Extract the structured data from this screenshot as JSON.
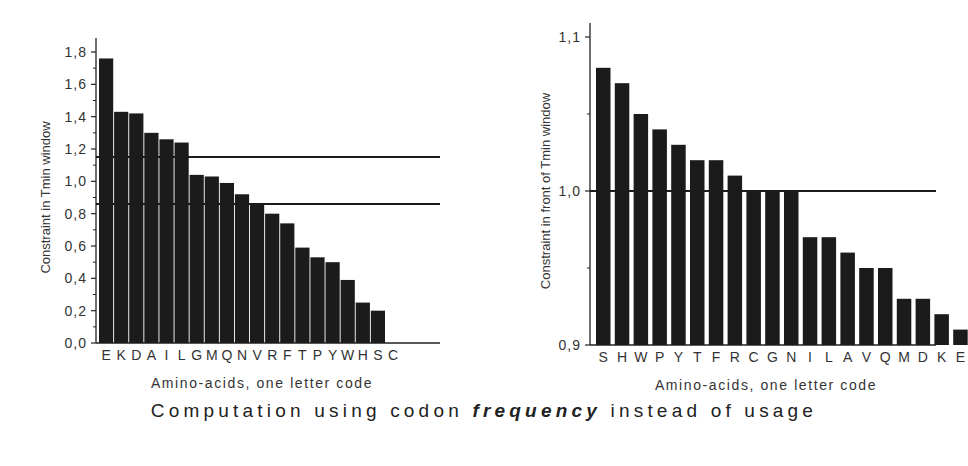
{
  "caption": {
    "prefix": "Computation using codon ",
    "emphasis": "frequency",
    "suffix": " instead of usage"
  },
  "chart_data": [
    {
      "type": "bar",
      "title": "",
      "xlabel": "Amino-acids, one letter code",
      "ylabel": "Constraint in Tmin window",
      "categories": [
        "E",
        "K",
        "D",
        "A",
        "I",
        "L",
        "G",
        "M",
        "Q",
        "N",
        "V",
        "R",
        "F",
        "T",
        "P",
        "Y",
        "W",
        "H",
        "S",
        "C"
      ],
      "values": [
        1.76,
        1.43,
        1.42,
        1.3,
        1.26,
        1.24,
        1.04,
        1.03,
        0.99,
        0.92,
        0.86,
        0.8,
        0.74,
        0.59,
        0.53,
        0.5,
        0.39,
        0.25,
        0.2,
        0.0
      ],
      "ylim": [
        0,
        1.8
      ],
      "yticks": [
        "0,0",
        "0,2",
        "0,4",
        "0,6",
        "0,8",
        "1,0",
        "1,2",
        "1,4",
        "1,6",
        "1,8"
      ],
      "reference_lines": [
        1.15,
        0.86
      ],
      "grid": false,
      "legend": null
    },
    {
      "type": "bar",
      "title": "",
      "xlabel": "Amino-acids, one letter code",
      "ylabel": "Constraint in front of Tmin window",
      "categories": [
        "S",
        "H",
        "W",
        "P",
        "Y",
        "T",
        "F",
        "R",
        "C",
        "G",
        "N",
        "I",
        "L",
        "A",
        "V",
        "Q",
        "M",
        "D",
        "K",
        "E"
      ],
      "values": [
        1.08,
        1.07,
        1.05,
        1.04,
        1.03,
        1.02,
        1.02,
        1.01,
        1.0,
        1.0,
        1.0,
        0.97,
        0.97,
        0.96,
        0.95,
        0.95,
        0.93,
        0.93,
        0.92,
        0.91
      ],
      "ylim": [
        0.9,
        1.1
      ],
      "yticks": [
        "0,9",
        "1,0",
        "1,1"
      ],
      "reference_lines": [
        1.0
      ],
      "grid": false,
      "legend": null
    }
  ]
}
